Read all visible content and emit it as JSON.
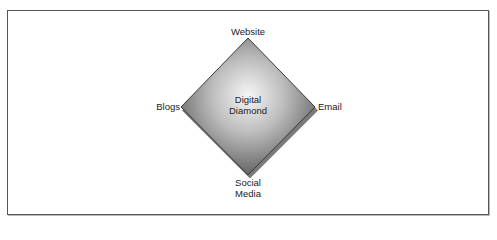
{
  "diagram": {
    "center_label_line1": "Digital",
    "center_label_line2": "Diamond",
    "vertices": {
      "top": "Website",
      "left": "Blogs",
      "right": "Email",
      "bottom_line1": "Social",
      "bottom_line2": "Media"
    },
    "colors": {
      "fill_center": "#f4f4f4",
      "fill_edge": "#6a6a6a",
      "outline": "#333333",
      "frame": "#555555"
    }
  }
}
